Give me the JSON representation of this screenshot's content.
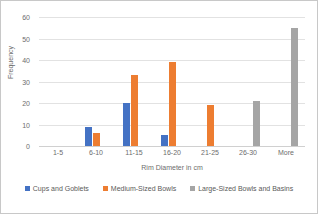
{
  "chart_data": {
    "type": "bar",
    "title": "",
    "xlabel": "Rim Diameter in cm",
    "ylabel": "Frequency",
    "categories": [
      "1-5",
      "6-10",
      "11-15",
      "16-20",
      "21-25",
      "26-30",
      "More"
    ],
    "yticks": [
      0,
      10,
      20,
      30,
      40,
      50,
      60
    ],
    "ylim": [
      0,
      60
    ],
    "grid": true,
    "legend_position": "bottom",
    "series": [
      {
        "name": "Cups and Goblets",
        "color": "#4472C4",
        "values": [
          0,
          9,
          20,
          5,
          0,
          0,
          0
        ]
      },
      {
        "name": "Medium-Sized Bowls",
        "color": "#ED7D31",
        "values": [
          0,
          6,
          33,
          39,
          19,
          0,
          0
        ]
      },
      {
        "name": "Large-Sized Bowls and Basins",
        "color": "#A5A5A5",
        "values": [
          0,
          0,
          0,
          0,
          0,
          21,
          55
        ]
      }
    ]
  }
}
